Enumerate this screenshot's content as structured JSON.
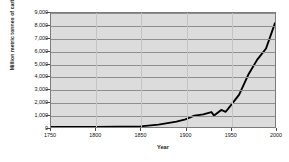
{
  "chart_data": {
    "type": "line",
    "title": "",
    "xlabel": "Year",
    "ylabel": "Million metric tonnes of carbon dioxide",
    "xlim": [
      1750,
      2000
    ],
    "ylim": [
      0,
      9000
    ],
    "xticks": [
      1750,
      1800,
      1850,
      1900,
      1950,
      2000
    ],
    "xticklabels": [
      "1750",
      "1800",
      "1850",
      "1900",
      "1950",
      "2000"
    ],
    "yticks": [
      0,
      1000,
      2000,
      3000,
      4000,
      5000,
      6000,
      7000,
      8000,
      9000
    ],
    "yticklabels": [
      "0",
      "1,000",
      "2,000",
      "3,000",
      "4,000",
      "5,000",
      "6,000",
      "7,000",
      "8,000",
      "9,000"
    ],
    "grid": true,
    "grid_axis": "y",
    "legend": false,
    "plot_background": "#dcdcdc",
    "line_color": "#000000",
    "series": [
      {
        "name": "Global carbon dioxide emissions",
        "x": [
          1750,
          1760,
          1770,
          1780,
          1790,
          1800,
          1810,
          1820,
          1830,
          1840,
          1850,
          1860,
          1870,
          1875,
          1880,
          1885,
          1890,
          1895,
          1900,
          1905,
          1910,
          1915,
          1920,
          1925,
          1929,
          1932,
          1935,
          1937,
          1940,
          1943,
          1945,
          1948,
          1950,
          1953,
          1956,
          1959,
          1962,
          1965,
          1968,
          1971,
          1974,
          1977,
          1979,
          1982,
          1985,
          1988,
          1991,
          1993,
          1995,
          1997,
          1999,
          2000
        ],
        "y": [
          10,
          11,
          12,
          14,
          16,
          20,
          26,
          34,
          45,
          62,
          198,
          330,
          520,
          620,
          760,
          900,
          1100,
          1290,
          1950,
          2300,
          2650,
          2800,
          2900,
          3450,
          3900,
          3050,
          3500,
          3950,
          4300,
          4600,
          4100,
          5200,
          6000,
          6700,
          7600,
          8400,
          9700,
          11000,
          12700,
          14600,
          16500,
          17900,
          19300,
          19000,
          19600,
          21500,
          22400,
          22300,
          23100,
          24000,
          24300,
          25000
        ],
        "y_scaled_note": "values plotted in million metric tonnes CO2; curve peaks near 8,200 at 2000"
      }
    ],
    "points": [
      {
        "year": 1750,
        "value": 3
      },
      {
        "year": 1800,
        "value": 8
      },
      {
        "year": 1850,
        "value": 54
      },
      {
        "year": 1870,
        "value": 190
      },
      {
        "year": 1890,
        "value": 420
      },
      {
        "year": 1900,
        "value": 600
      },
      {
        "year": 1910,
        "value": 900
      },
      {
        "year": 1920,
        "value": 1000
      },
      {
        "year": 1929,
        "value": 1180
      },
      {
        "year": 1932,
        "value": 900
      },
      {
        "year": 1940,
        "value": 1350
      },
      {
        "year": 1945,
        "value": 1200
      },
      {
        "year": 1950,
        "value": 1650
      },
      {
        "year": 1960,
        "value": 2550
      },
      {
        "year": 1970,
        "value": 4100
      },
      {
        "year": 1980,
        "value": 5300
      },
      {
        "year": 1990,
        "value": 6200
      },
      {
        "year": 2000,
        "value": 8200
      }
    ]
  },
  "axes": {
    "y_title": "Million metric tonnes of carbon dioxide",
    "x_title": "Year"
  }
}
